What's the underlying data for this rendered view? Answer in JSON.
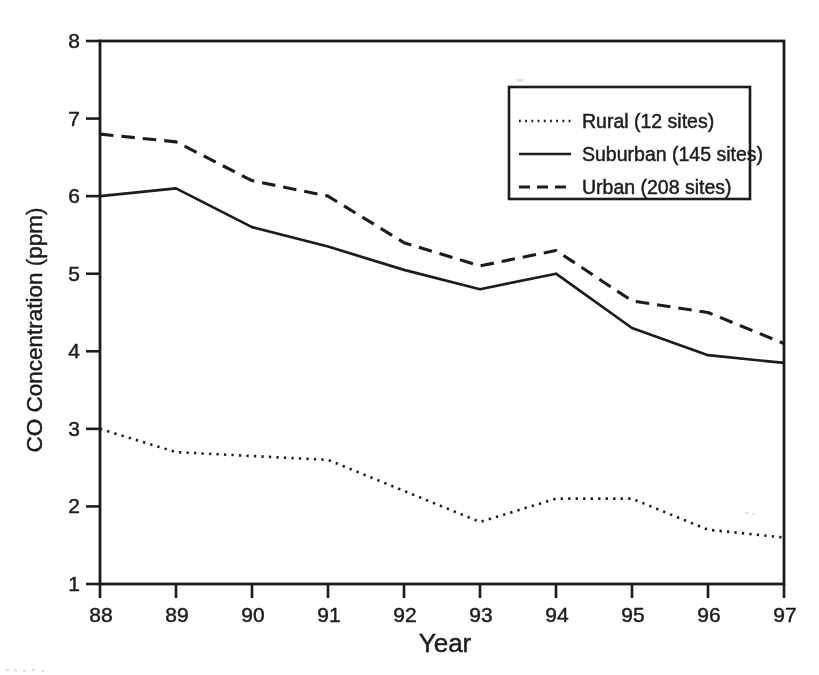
{
  "figure": {
    "background": "#ffffff",
    "ink": "#1c1c1c",
    "xlabel": "Year",
    "ylabel": "CO Concentration (ppm)"
  },
  "chart_data": {
    "type": "line",
    "title": "",
    "xlabel": "Year",
    "ylabel": "CO Concentration (ppm)",
    "x": [
      88,
      89,
      90,
      91,
      92,
      93,
      94,
      95,
      96,
      97
    ],
    "x_tick_labels": [
      "88",
      "89",
      "90",
      "91",
      "92",
      "93",
      "94",
      "95",
      "96",
      "97"
    ],
    "y_ticks": [
      1,
      2,
      3,
      4,
      5,
      6,
      7,
      8
    ],
    "xlim": [
      88,
      97
    ],
    "ylim": [
      1,
      8
    ],
    "grid": false,
    "legend_position": "upper-right-inside",
    "series": [
      {
        "name": "Rural (12 sites)",
        "line_style": "dotted",
        "color": "#1c1c1c",
        "values": [
          3.0,
          2.7,
          2.65,
          2.6,
          2.2,
          1.8,
          2.1,
          2.1,
          1.7,
          1.6
        ]
      },
      {
        "name": "Suburban (145 sites)",
        "line_style": "solid",
        "color": "#1c1c1c",
        "values": [
          6.0,
          6.1,
          5.6,
          5.35,
          5.05,
          4.8,
          5.0,
          4.3,
          3.95,
          3.85
        ]
      },
      {
        "name": "Urban (208 sites)",
        "line_style": "dashed",
        "color": "#1c1c1c",
        "values": [
          6.8,
          6.7,
          6.2,
          6.0,
          5.4,
          5.1,
          5.3,
          4.65,
          4.5,
          4.1
        ]
      }
    ]
  }
}
